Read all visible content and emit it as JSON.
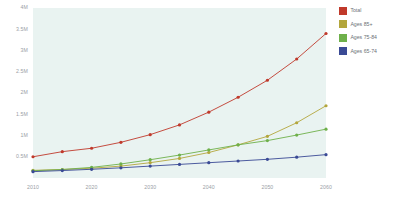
{
  "chart_data": {
    "type": "line",
    "title": "",
    "subtitle": "",
    "xlabel": "",
    "ylabel": "",
    "x": [
      2010,
      2015,
      2020,
      2025,
      2030,
      2035,
      2040,
      2045,
      2050,
      2055,
      2060
    ],
    "xlim": [
      2010,
      2060
    ],
    "ylim": [
      0,
      4000000
    ],
    "x_ticks": [
      2010,
      2020,
      2030,
      2040,
      2050,
      2060
    ],
    "x_tick_labels": [
      "2010",
      "2020",
      "2030",
      "2040",
      "2050",
      "2060"
    ],
    "y_ticks": [
      500000,
      1000000,
      1500000,
      2000000,
      2500000,
      3000000,
      3500000,
      4000000
    ],
    "y_tick_labels": [
      "0.5M",
      "1M",
      "1.5M",
      "2M",
      "2.5M",
      "3M",
      "3.5M",
      "4M"
    ],
    "grid": false,
    "legend_position": "right",
    "markers": true,
    "plot_background": "#e9f3f1",
    "series": [
      {
        "name": "Total",
        "color": "#c0392b",
        "values": [
          500000,
          620000,
          700000,
          840000,
          1020000,
          1250000,
          1550000,
          1900000,
          2300000,
          2800000,
          3400000
        ]
      },
      {
        "name": "Ages 85+",
        "color": "#b3a63c",
        "values": [
          180000,
          200000,
          230000,
          280000,
          360000,
          460000,
          600000,
          780000,
          980000,
          1300000,
          1700000
        ]
      },
      {
        "name": "Ages 75-84",
        "color": "#6eb04a",
        "values": [
          170000,
          200000,
          250000,
          330000,
          430000,
          540000,
          660000,
          780000,
          880000,
          1010000,
          1150000
        ]
      },
      {
        "name": "Ages 65-74",
        "color": "#3a4a95",
        "values": [
          150000,
          175000,
          205000,
          240000,
          280000,
          320000,
          360000,
          400000,
          440000,
          490000,
          550000
        ]
      }
    ]
  },
  "legend": {
    "items": [
      {
        "label": "Total",
        "color": "#c0392b"
      },
      {
        "label": "Ages 85+",
        "color": "#b3a63c"
      },
      {
        "label": "Ages 75-84",
        "color": "#6eb04a"
      },
      {
        "label": "Ages 65-74",
        "color": "#3a4a95"
      }
    ]
  }
}
